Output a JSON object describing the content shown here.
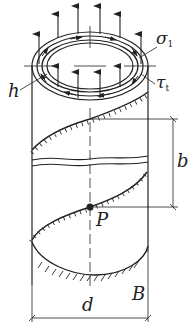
{
  "diagram": {
    "type": "thin-walled cylinder with helical weld under axial stress and shear",
    "labels": {
      "sigma": "σ",
      "sigma_sub": "1",
      "tau": "τ",
      "tau_sub": "t",
      "thickness": "h",
      "pitch": "b",
      "point": "P",
      "support": "B",
      "diameter": "d"
    },
    "colors": {
      "line": "#222222",
      "background": "#ffffff"
    }
  }
}
